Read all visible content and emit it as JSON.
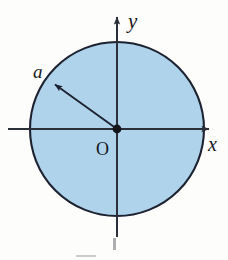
{
  "figure": {
    "kind": "math-diagram",
    "labels": {
      "y_axis": "y",
      "x_axis": "x",
      "origin": "O",
      "radius": "a"
    },
    "colors": {
      "disk_fill": "#aed3ea",
      "disk_stroke": "#1d2230",
      "axis": "#2a2f3a",
      "label_text": "#15161c",
      "background": "#fdfdfc",
      "caption_fragment": "#6e6e72"
    },
    "geometry": {
      "center_x": 117,
      "center_y": 129,
      "radius_px": 87,
      "x_axis_start_x": 8,
      "x_axis_end_x": 212,
      "y_axis_top_y": 14,
      "y_axis_bottom_y": 237,
      "radius_arrow_tip_x": 52,
      "radius_arrow_tip_y": 82,
      "radius_arrow_angle_deg": 144
    },
    "caption": {
      "visible_text": "",
      "note": "caption is cropped off the bottom edge; only faint glyph fragments remain"
    }
  }
}
